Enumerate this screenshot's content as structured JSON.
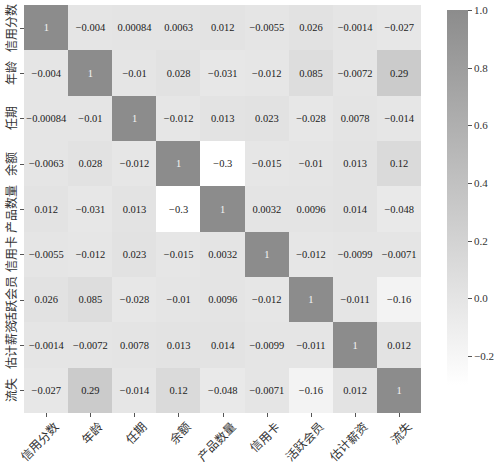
{
  "chart_data": {
    "type": "heatmap",
    "title": "",
    "xlabel": "",
    "ylabel": "",
    "labels": [
      "信用分数",
      "年龄",
      "任期",
      "余额",
      "产品数量",
      "信用卡",
      "活跃会员",
      "估计薪资",
      "流失"
    ],
    "matrix": [
      [
        1,
        -0.004,
        0.00084,
        0.0063,
        0.012,
        -0.0055,
        0.026,
        -0.0014,
        -0.027
      ],
      [
        -0.004,
        1,
        -0.01,
        0.028,
        -0.031,
        -0.012,
        0.085,
        -0.0072,
        0.29
      ],
      [
        -0.00084,
        -0.01,
        1,
        -0.012,
        0.013,
        0.023,
        -0.028,
        0.0078,
        -0.014
      ],
      [
        -0.0063,
        0.028,
        -0.012,
        1,
        -0.3,
        -0.015,
        -0.01,
        0.013,
        0.12
      ],
      [
        0.012,
        -0.031,
        0.013,
        -0.3,
        1,
        0.0032,
        0.0096,
        0.014,
        -0.048
      ],
      [
        -0.0055,
        -0.012,
        0.023,
        -0.015,
        0.0032,
        1,
        -0.012,
        -0.0099,
        -0.0071
      ],
      [
        0.026,
        0.085,
        -0.028,
        -0.01,
        0.0096,
        -0.012,
        1,
        -0.011,
        -0.16
      ],
      [
        -0.0014,
        -0.0072,
        0.0078,
        0.013,
        0.014,
        -0.0099,
        -0.011,
        1,
        0.012
      ],
      [
        -0.027,
        0.29,
        -0.014,
        0.12,
        -0.048,
        -0.0071,
        -0.16,
        0.012,
        1
      ]
    ],
    "colorbar": {
      "ticks": [
        1.0,
        0.8,
        0.6,
        0.4,
        0.2,
        0.0,
        -0.2
      ],
      "tick_labels": [
        "1.0",
        "0.8",
        "0.6",
        "0.4",
        "0.2",
        "0.0",
        "−0.2"
      ],
      "range": [
        -0.3,
        1.0
      ],
      "color_min": "#ffffff",
      "color_max": "#8c8c8c"
    }
  }
}
